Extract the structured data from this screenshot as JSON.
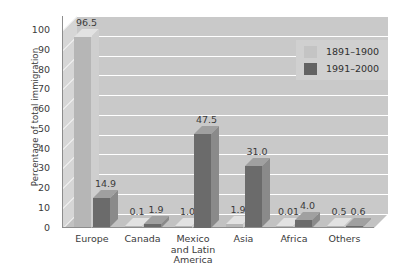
{
  "chart_data": {
    "type": "bar",
    "title": "",
    "xlabel": "",
    "ylabel": "Percentage of total immigration",
    "ylim": [
      0,
      100
    ],
    "yticks": [
      100,
      90,
      80,
      70,
      60,
      50,
      40,
      30,
      20,
      10,
      0
    ],
    "grid": true,
    "legend_position": "top-right-inside",
    "style": "3d-bar",
    "categories": [
      "Europe",
      "Canada",
      "Mexico and Latin America",
      "Asia",
      "Africa",
      "Others"
    ],
    "category_label_lines": [
      [
        "Europe"
      ],
      [
        "Canada"
      ],
      [
        "Mexico",
        "and Latin",
        "America"
      ],
      [
        "Asia"
      ],
      [
        "Africa"
      ],
      [
        "Others"
      ]
    ],
    "series": [
      {
        "name": "1891–1900",
        "color": "#b6b6b6",
        "values": [
          96.5,
          0.1,
          1.0,
          1.9,
          0.01,
          0.5
        ],
        "labels": [
          "96.5",
          "0.1",
          "1.0",
          "1.9",
          "0.01",
          "0.5"
        ]
      },
      {
        "name": "1991–2000",
        "color": "#6b6b6b",
        "values": [
          14.9,
          1.9,
          47.5,
          31.0,
          4.0,
          0.6
        ],
        "labels": [
          "14.9",
          "1.9",
          "47.5",
          "31.0",
          "4.0",
          "0.6"
        ]
      }
    ]
  },
  "colors": {
    "plot_background": "#c9c9c9",
    "side_wall": "#d6d6d6",
    "floor": "#c2c2c2",
    "gridline": "#ffffff",
    "text": "#3b3b3b",
    "legend_background": "#d0d0d0",
    "series_light": "#b6b6b6",
    "series_dark": "#6b6b6b"
  }
}
